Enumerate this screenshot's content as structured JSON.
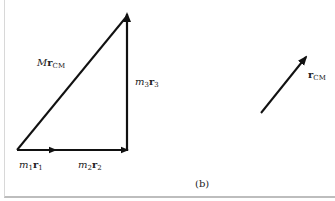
{
  "figure": {
    "panel_label": "(b)",
    "colors": {
      "stroke": "#111111",
      "background": "#ffffff",
      "border": "#bdbdbd"
    },
    "vectors": [
      {
        "id": "m1r1",
        "label": {
          "coef": "m",
          "coef_sub": "1",
          "vec": "r",
          "vec_sub": "1"
        }
      },
      {
        "id": "m2r2",
        "label": {
          "coef": "m",
          "coef_sub": "2",
          "vec": "r",
          "vec_sub": "2"
        }
      },
      {
        "id": "m3r3",
        "label": {
          "coef": "m",
          "coef_sub": "3",
          "vec": "r",
          "vec_sub": "3"
        }
      },
      {
        "id": "MrCM",
        "label": {
          "coef": "M",
          "coef_sub": "",
          "vec": "r",
          "vec_sub": "CM"
        }
      },
      {
        "id": "rCM",
        "label": {
          "coef": "",
          "coef_sub": "",
          "vec": "r",
          "vec_sub": "CM"
        }
      }
    ]
  }
}
